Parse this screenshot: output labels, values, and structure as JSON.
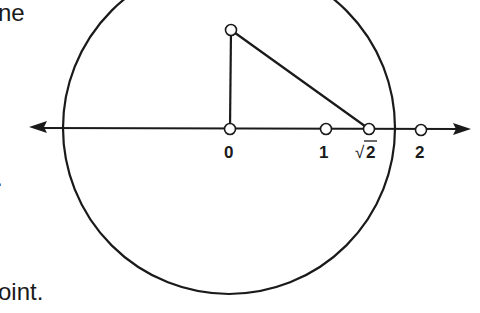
{
  "text_fragments": {
    "top": "ne",
    "middle": ".",
    "bottom": "oint."
  },
  "diagram": {
    "stroke_color": "#1a1a1a",
    "point_fill": "#ffffff",
    "labels": {
      "zero": "0",
      "one": "1",
      "sqrt2_radical": "√",
      "sqrt2_value": "2",
      "two": "2"
    },
    "points": [
      {
        "name": "origin",
        "value": 0
      },
      {
        "name": "one",
        "value": 1
      },
      {
        "name": "sqrt2",
        "value": 1.414
      },
      {
        "name": "two",
        "value": 2
      },
      {
        "name": "apex",
        "x": 0,
        "y": 1
      }
    ]
  }
}
